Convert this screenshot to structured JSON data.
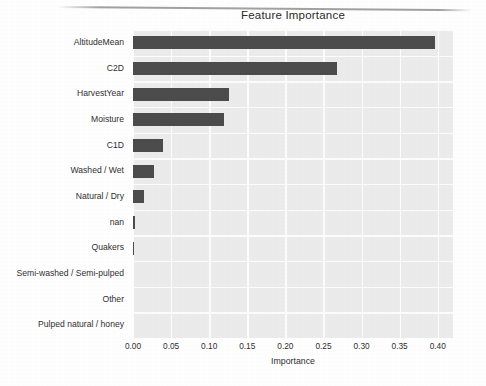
{
  "chart_data": {
    "type": "bar",
    "orientation": "horizontal",
    "title": "Feature Importance",
    "xlabel": "Importance",
    "ylabel": "",
    "xlim": [
      0.0,
      0.42
    ],
    "xticks": [
      "0.00",
      "0.05",
      "0.10",
      "0.15",
      "0.20",
      "0.25",
      "0.30",
      "0.35",
      "0.40"
    ],
    "xtick_values": [
      0.0,
      0.05,
      0.1,
      0.15,
      0.2,
      0.25,
      0.3,
      0.35,
      0.4
    ],
    "grid": "white gridlines on light gray panel",
    "legend": "none",
    "categories": [
      "AltitudeMean",
      "C2D",
      "HarvestYear",
      "Moisture",
      "C1D",
      "Washed / Wet",
      "Natural / Dry",
      "nan",
      "Quakers",
      "Semi-washed / Semi-pulped",
      "Other",
      "Pulped natural / honey"
    ],
    "values": [
      0.397,
      0.268,
      0.126,
      0.119,
      0.04,
      0.027,
      0.014,
      0.0025,
      0.0012,
      0.0,
      0.0,
      0.0
    ],
    "bar_color": "#4c4c4c",
    "panel_color": "#ececed",
    "gridline_color": "#fdfdfd"
  },
  "figure": {
    "title": "Feature Importance",
    "xaxis_label": "Importance"
  }
}
